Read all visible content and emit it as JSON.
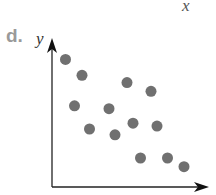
{
  "panel": {
    "label": "d.",
    "top_axis_label": "x"
  },
  "chart_data": {
    "type": "scatter",
    "title": "",
    "xlabel": "",
    "ylabel": "y",
    "grid": false,
    "legend": null,
    "point_color": "#707070",
    "axis_color": "#222222",
    "xlim": [
      0,
      10
    ],
    "ylim": [
      0,
      10
    ],
    "points": [
      {
        "x": 0.9,
        "y": 8.8
      },
      {
        "x": 2.0,
        "y": 7.7
      },
      {
        "x": 1.5,
        "y": 5.6
      },
      {
        "x": 5.0,
        "y": 7.2
      },
      {
        "x": 6.6,
        "y": 6.6
      },
      {
        "x": 3.8,
        "y": 5.4
      },
      {
        "x": 2.5,
        "y": 4.0
      },
      {
        "x": 4.2,
        "y": 3.6
      },
      {
        "x": 5.4,
        "y": 4.4
      },
      {
        "x": 7.0,
        "y": 4.2
      },
      {
        "x": 5.9,
        "y": 2.0
      },
      {
        "x": 7.7,
        "y": 2.0
      },
      {
        "x": 8.8,
        "y": 1.4
      }
    ],
    "trend": "negative correlation"
  }
}
